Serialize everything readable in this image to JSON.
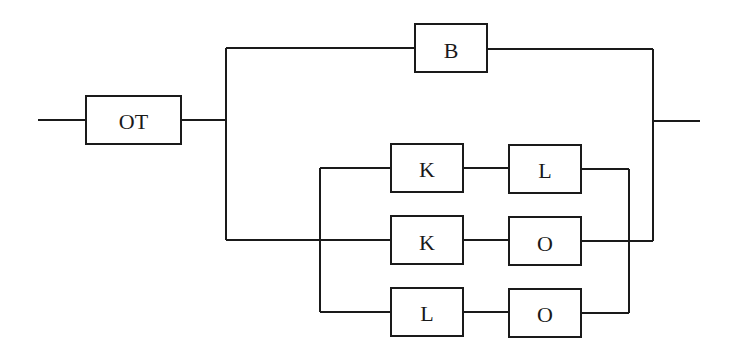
{
  "diagram": {
    "type": "reliability-block-diagram",
    "colors": {
      "line": "#1a1a1a",
      "background": "#ffffff"
    },
    "blocks": {
      "ot": {
        "label": "OT"
      },
      "b": {
        "label": "B"
      },
      "row1_a": {
        "label": "K"
      },
      "row1_b": {
        "label": "L"
      },
      "row2_a": {
        "label": "K"
      },
      "row2_b": {
        "label": "O"
      },
      "row3_a": {
        "label": "L"
      },
      "row3_b": {
        "label": "O"
      }
    },
    "structure": "OT in series with parallel( B , parallel( K-L , K-O , L-O ) )"
  }
}
